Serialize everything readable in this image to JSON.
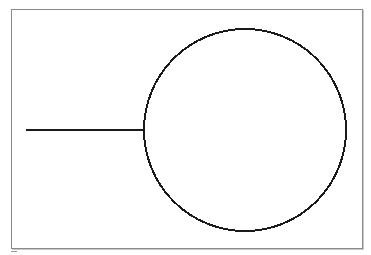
{
  "diagram": {
    "frame": {
      "x": 11,
      "y": 9,
      "width": 351,
      "height": 239,
      "border_color": "#8a8a8a"
    },
    "shapes": [
      {
        "type": "line",
        "name": "stem-line",
        "x1": 26,
        "y1": 130,
        "x2": 144,
        "y2": 130,
        "stroke": "#1a1a1a",
        "stroke_width": 2
      },
      {
        "type": "circle",
        "name": "main-circle",
        "cx": 245,
        "cy": 130,
        "r": 101,
        "stroke": "#1a1a1a",
        "stroke_width": 2,
        "fill": "none"
      }
    ],
    "caption": ""
  }
}
